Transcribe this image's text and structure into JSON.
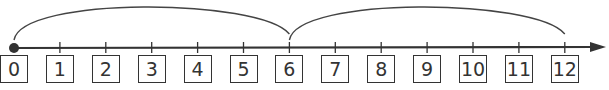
{
  "number_line": {
    "start": 0,
    "end": 12,
    "step": 1,
    "labels": [
      "0",
      "1",
      "2",
      "3",
      "4",
      "5",
      "6",
      "7",
      "8",
      "9",
      "10",
      "11",
      "12"
    ],
    "start_marker": "filled-dot",
    "end_marker": "arrow",
    "line_color": "#333333"
  },
  "jumps": [
    {
      "from": 0,
      "to": 6
    },
    {
      "from": 6,
      "to": 12
    }
  ]
}
